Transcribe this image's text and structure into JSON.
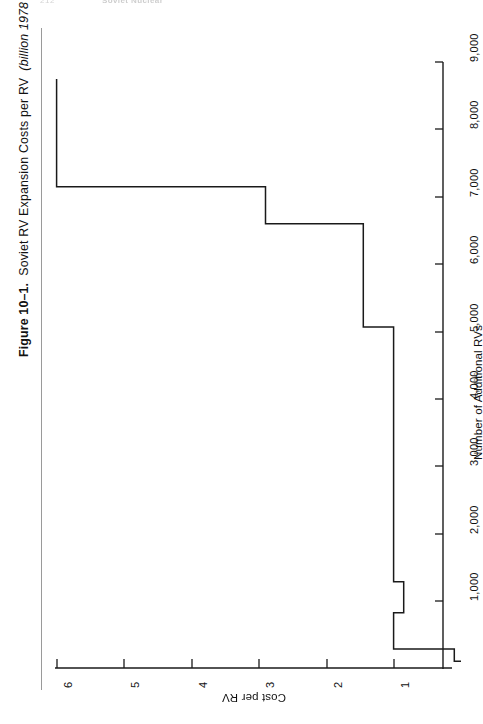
{
  "running_head": {
    "folio": "212",
    "title": "Soviet Nuclear"
  },
  "caption": {
    "label": "Figure 10–1.",
    "title": "Soviet RV Expansion Costs per RV",
    "units": "(billion 1978 dollars)."
  },
  "chart_data": {
    "type": "line",
    "subtype": "step",
    "title": "Soviet RV Expansion Costs per RV",
    "orientation": "rotated-90-ccw",
    "xlabel": "Number of Additional RVs",
    "ylabel": "Cost per RV",
    "xlim": [
      0,
      9500
    ],
    "ylim": [
      0,
      6.4
    ],
    "xticks": [
      1000,
      2000,
      3000,
      4000,
      5000,
      6000,
      7000,
      8000,
      9000
    ],
    "xtick_labels": [
      "1,000",
      "2,000",
      "3,000",
      "4,000",
      "5,000",
      "6,000",
      "7,000",
      "8,000",
      "9,000"
    ],
    "yticks": [
      1,
      2,
      3,
      4,
      5,
      6
    ],
    "ytick_labels": [
      "1",
      "2",
      "3",
      "4",
      "5",
      "6"
    ],
    "grid": false,
    "legend": null,
    "series": [
      {
        "name": "Cost per RV",
        "steps": [
          {
            "x_start": 100,
            "x_end": 280,
            "y": 0.1
          },
          {
            "x_start": 280,
            "x_end": 820,
            "y": 1.0
          },
          {
            "x_start": 820,
            "x_end": 1280,
            "y": 0.85
          },
          {
            "x_start": 1280,
            "x_end": 5060,
            "y": 1.0
          },
          {
            "x_start": 5060,
            "x_end": 6590,
            "y": 1.45
          },
          {
            "x_start": 6590,
            "x_end": 7140,
            "y": 2.9
          },
          {
            "x_start": 7140,
            "x_end": 8740,
            "y": 6.0
          }
        ],
        "points": [
          {
            "x": 100,
            "y": 0.0
          },
          {
            "x": 100,
            "y": 0.1
          },
          {
            "x": 280,
            "y": 0.1
          },
          {
            "x": 280,
            "y": 1.0
          },
          {
            "x": 820,
            "y": 1.0
          },
          {
            "x": 820,
            "y": 0.85
          },
          {
            "x": 1280,
            "y": 0.85
          },
          {
            "x": 1280,
            "y": 1.0
          },
          {
            "x": 5060,
            "y": 1.0
          },
          {
            "x": 5060,
            "y": 1.45
          },
          {
            "x": 6590,
            "y": 1.45
          },
          {
            "x": 6590,
            "y": 2.9
          },
          {
            "x": 7140,
            "y": 2.9
          },
          {
            "x": 7140,
            "y": 6.0
          },
          {
            "x": 8740,
            "y": 6.0
          }
        ]
      }
    ]
  }
}
